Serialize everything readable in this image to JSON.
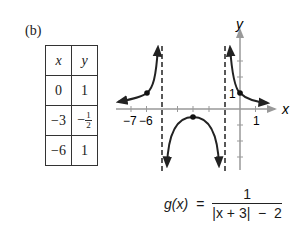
{
  "figure": {
    "label": "(b)"
  },
  "table": {
    "headers": [
      "x",
      "y"
    ],
    "rows": [
      {
        "x": "0",
        "y": "1"
      },
      {
        "x": "−3",
        "y_sign": "−",
        "y_num": "1",
        "y_den": "2"
      },
      {
        "x": "−6",
        "y": "1"
      }
    ]
  },
  "graph": {
    "x_axis_label": "x",
    "y_axis_label": "y",
    "x_tick_labels": [
      "−7",
      "−6",
      "1"
    ],
    "y_tick_label": "1",
    "asymptotes_x": [
      -5,
      -1
    ],
    "points": [
      [
        -6,
        1
      ],
      [
        -3,
        -0.5
      ],
      [
        0,
        1
      ]
    ]
  },
  "formula": {
    "lhs": "g(x)",
    "eq": "=",
    "numerator": "1",
    "denominator": "|x + 3|  −  2"
  }
}
